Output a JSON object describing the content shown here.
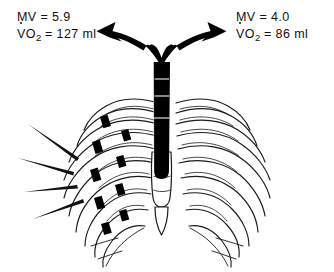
{
  "figure": {
    "background_color": "#ffffff",
    "ink_color": "#000000"
  },
  "labels": {
    "left": {
      "name": "left-lung-measurements",
      "minute_ventilation": "MV = 5.9",
      "oxygen_uptake_prefix": "V",
      "oxygen_uptake_sub": "2",
      "oxygen_uptake_value": "O",
      "oxygen_uptake_line": "O",
      "oxygen_uptake_rest": " = 127 ml"
    },
    "right": {
      "name": "right-lung-measurements",
      "minute_ventilation": "MV = 4.0",
      "oxygen_uptake_prefix": "V",
      "oxygen_uptake_sub": "2",
      "oxygen_uptake_rest": " = 86 ml"
    }
  },
  "anatomy": {
    "trachea": "trachea",
    "carina": "carina",
    "left_main_bronchus": "left-main-bronchus",
    "right_main_bronchus": "right-main-bronchus",
    "sternum": "sternum",
    "xiphoid_process": "xiphoid-process",
    "left_ribcage": "left-ribcage",
    "right_ribcage": "right-ribcage",
    "flail_segment": "flail-segment-rib-fractures",
    "pain_lines": "radiating-injury-lines",
    "arrow_left": "airflow-arrow-left",
    "arrow_right": "airflow-arrow-right"
  },
  "measurements": {
    "left_mv": "5.9",
    "right_mv": "4.0",
    "left_vo2_ml": "127",
    "right_vo2_ml": "86",
    "mv_unit": "",
    "vo2_unit": "ml"
  }
}
